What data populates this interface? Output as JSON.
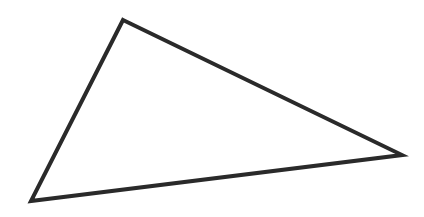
{
  "diagram": {
    "shape": "triangle",
    "vertices": [
      {
        "name": "top",
        "x": 123,
        "y": 20
      },
      {
        "name": "right",
        "x": 402,
        "y": 155
      },
      {
        "name": "bottom-left",
        "x": 31,
        "y": 201
      }
    ],
    "stroke_color": "#2a2a2a",
    "stroke_width": 4,
    "fill": "none",
    "background": "#ffffff"
  }
}
